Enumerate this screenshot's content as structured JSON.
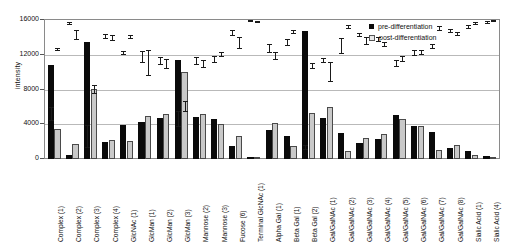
{
  "chart_data": {
    "type": "bar",
    "title": "",
    "xlabel": "",
    "ylabel": "intensity",
    "ylim": [
      0,
      16000
    ],
    "yticks": [
      0,
      4000,
      8000,
      12000,
      16000
    ],
    "ytick_labels": [
      "0",
      "4000",
      "8000",
      "12000",
      "16000"
    ],
    "grid": true,
    "legend_position": "top-right",
    "categories": [
      "Complex (1)",
      "Complex (2)",
      "Complex (3)",
      "Complex (4)",
      "GlcNAc (1)",
      "GlcMan (1)",
      "GlcMan (2)",
      "GlcMan (3)",
      "Mannose (2)",
      "Mannose (3)",
      "Fucose (6)",
      "Terminal GlcNAc (1)",
      "Alpha Gal (1)",
      "Beta Gal (1)",
      "Beta Gal (2)",
      "Gal/GalNAc (1)",
      "Gal/GalNAc (2)",
      "Gal/GalNAc (3)",
      "Gal/GalNAc (4)",
      "Gal/GalNAc (5)",
      "Gal/GalNAc (6)",
      "Gal/GalNAc (7)",
      "Gal/GalNAc (8)",
      "Sialic Acid (1)",
      "Sialic Acid (4)"
    ],
    "series": [
      {
        "name": "pre-differentiation",
        "color": "#0a0a0a",
        "values": [
          10850,
          430,
          13500,
          1950,
          3900,
          4300,
          4750,
          11450,
          4800,
          4600,
          1550,
          180,
          3300,
          2650,
          14700,
          4750,
          3050,
          1800,
          2300,
          5050,
          3850,
          3100,
          1300,
          900,
          330
        ],
        "errors": [
          750,
          120,
          1250,
          220,
          180,
          600,
          380,
          850,
          400,
          300,
          280,
          60,
          450,
          320,
          250,
          220,
          900,
          180,
          280,
          360,
          330,
          220,
          200,
          180,
          80
        ]
      },
      {
        "name": "post-differentiation",
        "color": "#c9c9c9",
        "values": [
          3400,
          1750,
          8050,
          2150,
          2050,
          5000,
          5150,
          10000,
          5150,
          4000,
          2700,
          280,
          4200,
          1450,
          5350,
          6000,
          900,
          2450,
          2900,
          4550,
          3800,
          1050,
          1650,
          500,
          140
        ],
        "errors": [
          120,
          520,
          450,
          320,
          180,
          1400,
          500,
          600,
          400,
          250,
          600,
          80,
          420,
          130,
          260,
          1100,
          180,
          380,
          220,
          250,
          250,
          200,
          180,
          120,
          40
        ]
      }
    ]
  },
  "legend": {
    "items": [
      {
        "label": "pre-differentiation",
        "style": "filled-black"
      },
      {
        "label": "post-differentiation",
        "style": "outlined-light"
      }
    ]
  },
  "axis": {
    "y_title": "intensity"
  }
}
